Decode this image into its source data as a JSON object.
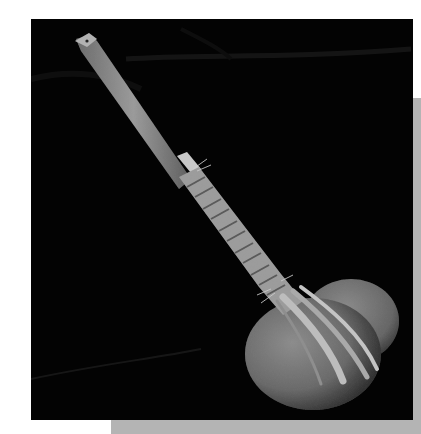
{
  "image": {
    "alt": "Black-and-white photograph of a long wooden stick with a fiber-bound end lashed to a round coconut-like gourd, on a dark background",
    "subject": "wooden stick with bound gourd",
    "colors": {
      "background": "#ffffff",
      "photo_background": "#030303",
      "shadow": "#b4b4b4",
      "stick": "#8a8a8a",
      "binding": "#a8a8a8",
      "gourd": "#6e6e6e"
    }
  }
}
